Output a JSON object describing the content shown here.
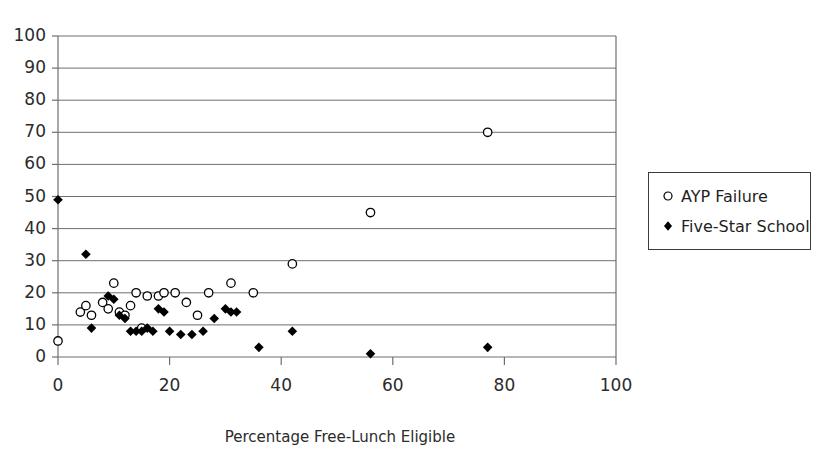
{
  "chart_data": {
    "type": "scatter",
    "title": "",
    "xlabel": "Percentage Free-Lunch Eligible",
    "ylabel": "",
    "xlim": [
      0,
      100
    ],
    "ylim": [
      0,
      100
    ],
    "xticks": [
      "0",
      "20",
      "40",
      "60",
      "80",
      "100"
    ],
    "xtick_values": [
      0,
      20,
      40,
      60,
      80,
      100
    ],
    "yticks": [
      "0",
      "10",
      "20",
      "30",
      "40",
      "50",
      "60",
      "70",
      "80",
      "90",
      "100"
    ],
    "ytick_values": [
      0,
      10,
      20,
      30,
      40,
      50,
      60,
      70,
      80,
      90,
      100
    ],
    "grid": "horizontal",
    "legend_position": "right",
    "series": [
      {
        "name": "AYP Failure",
        "marker": "open-circle",
        "color": "#000000",
        "points": [
          [
            0,
            5
          ],
          [
            4,
            14
          ],
          [
            5,
            16
          ],
          [
            6,
            13
          ],
          [
            8,
            17
          ],
          [
            9,
            15
          ],
          [
            10,
            23
          ],
          [
            11,
            14
          ],
          [
            12,
            13
          ],
          [
            13,
            16
          ],
          [
            14,
            20
          ],
          [
            15,
            9
          ],
          [
            16,
            19
          ],
          [
            18,
            19
          ],
          [
            19,
            20
          ],
          [
            21,
            20
          ],
          [
            23,
            17
          ],
          [
            25,
            13
          ],
          [
            27,
            20
          ],
          [
            31,
            23
          ],
          [
            35,
            20
          ],
          [
            42,
            29
          ],
          [
            56,
            45
          ],
          [
            77,
            70
          ]
        ]
      },
      {
        "name": "Five-Star School",
        "marker": "filled-diamond",
        "color": "#000000",
        "points": [
          [
            0,
            49
          ],
          [
            5,
            32
          ],
          [
            6,
            9
          ],
          [
            9,
            19
          ],
          [
            10,
            18
          ],
          [
            11,
            13
          ],
          [
            12,
            12
          ],
          [
            13,
            8
          ],
          [
            14,
            8
          ],
          [
            15,
            8
          ],
          [
            16,
            9
          ],
          [
            17,
            8
          ],
          [
            18,
            15
          ],
          [
            19,
            14
          ],
          [
            20,
            8
          ],
          [
            22,
            7
          ],
          [
            24,
            7
          ],
          [
            26,
            8
          ],
          [
            28,
            12
          ],
          [
            30,
            15
          ],
          [
            31,
            14
          ],
          [
            32,
            14
          ],
          [
            36,
            3
          ],
          [
            42,
            8
          ],
          [
            56,
            1
          ],
          [
            77,
            3
          ]
        ]
      }
    ]
  },
  "legend": {
    "items": [
      {
        "label": "AYP Failure",
        "marker": "open-circle"
      },
      {
        "label": "Five-Star School",
        "marker": "filled-diamond"
      }
    ]
  },
  "axis": {
    "x_title": "Percentage Free-Lunch Eligible"
  }
}
